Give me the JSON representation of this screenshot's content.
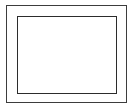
{
  "figure": {
    "kind": "nested-rectangles-diagram",
    "title": "",
    "caption": "",
    "background_color": "#ffffff",
    "width_px": 136,
    "height_px": 111,
    "text_content": "",
    "shape_count": 2
  },
  "outer_rectangle": {
    "label": "",
    "stroke_color": "#3c3c3c",
    "fill_color": "#fefefe",
    "stroke_width_px": 1,
    "x_px": 6,
    "y_px": 5,
    "width_px": 121,
    "height_px": 98,
    "content": ""
  },
  "inner_rectangle": {
    "label": "",
    "stroke_color": "#2b2b2b",
    "fill_color": "#ffffff",
    "stroke_width_px": 1,
    "x_px": 16,
    "y_px": 15,
    "width_px": 100,
    "height_px": 78,
    "content": ""
  },
  "frame_margin": {
    "label": "",
    "fill_color": "#fefefe",
    "content": ""
  }
}
